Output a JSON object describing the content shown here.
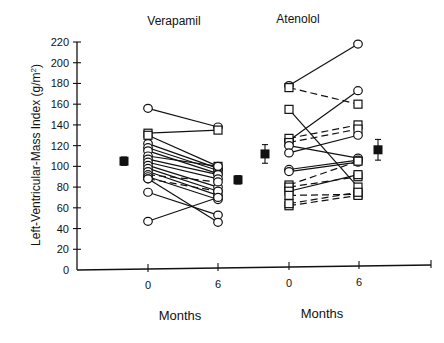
{
  "chart_data": {
    "type": "scatter",
    "title": "",
    "panels": [
      {
        "name": "Verapamil",
        "xlabel": "Months",
        "x_ticks": [
          "0",
          "6"
        ],
        "pairs": [
          {
            "m0": 156,
            "m6": 138,
            "marker": "circle",
            "style": "solid"
          },
          {
            "m0": 132,
            "m6": 135,
            "marker": "square",
            "style": "solid"
          },
          {
            "m0": 130,
            "m6": 100,
            "marker": "square",
            "style": "solid"
          },
          {
            "m0": 122,
            "m6": 98,
            "marker": "circle",
            "style": "solid"
          },
          {
            "m0": 118,
            "m6": 96,
            "marker": "circle",
            "style": "solid"
          },
          {
            "m0": 115,
            "m6": 93,
            "marker": "circle",
            "style": "solid"
          },
          {
            "m0": 110,
            "m6": 100,
            "marker": "circle",
            "style": "solid"
          },
          {
            "m0": 107,
            "m6": 92,
            "marker": "circle",
            "style": "solid"
          },
          {
            "m0": 104,
            "m6": 88,
            "marker": "circle",
            "style": "solid"
          },
          {
            "m0": 101,
            "m6": 80,
            "marker": "circle",
            "style": "solid"
          },
          {
            "m0": 98,
            "m6": 76,
            "marker": "circle",
            "style": "solid"
          },
          {
            "m0": 95,
            "m6": 72,
            "marker": "circle",
            "style": "solid"
          },
          {
            "m0": 92,
            "m6": 85,
            "marker": "circle",
            "style": "dashed"
          },
          {
            "m0": 90,
            "m6": 68,
            "marker": "circle",
            "style": "solid"
          },
          {
            "m0": 88,
            "m6": 76,
            "marker": "circle",
            "style": "dashed"
          },
          {
            "m0": 75,
            "m6": 53,
            "marker": "circle",
            "style": "solid"
          },
          {
            "m0": 88,
            "m6": 46,
            "marker": "circle",
            "style": "solid"
          },
          {
            "m0": 47,
            "m6": 70,
            "marker": "circle",
            "style": "solid"
          }
        ],
        "mean_before": {
          "value": 105,
          "error": 4
        },
        "mean_after": {
          "value": 87,
          "error": 4
        }
      },
      {
        "name": "Atenolol",
        "xlabel": "Months",
        "x_ticks": [
          "0",
          "6"
        ],
        "pairs": [
          {
            "m0": 178,
            "m6": 218,
            "marker": "circle",
            "style": "solid"
          },
          {
            "m0": 176,
            "m6": 160,
            "marker": "square",
            "style": "dashed"
          },
          {
            "m0": 155,
            "m6": 80,
            "marker": "square",
            "style": "solid"
          },
          {
            "m0": 125,
            "m6": 173,
            "marker": "circle",
            "style": "solid"
          },
          {
            "m0": 127,
            "m6": 140,
            "marker": "square",
            "style": "dashed"
          },
          {
            "m0": 123,
            "m6": 136,
            "marker": "square",
            "style": "dashed"
          },
          {
            "m0": 120,
            "m6": 108,
            "marker": "circle",
            "style": "solid"
          },
          {
            "m0": 113,
            "m6": 130,
            "marker": "circle",
            "style": "solid"
          },
          {
            "m0": 97,
            "m6": 106,
            "marker": "circle",
            "style": "solid"
          },
          {
            "m0": 95,
            "m6": 104,
            "marker": "circle",
            "style": "solid"
          },
          {
            "m0": 82,
            "m6": 105,
            "marker": "square",
            "style": "dashed"
          },
          {
            "m0": 80,
            "m6": 90,
            "marker": "square",
            "style": "dashed"
          },
          {
            "m0": 76,
            "m6": 92,
            "marker": "square",
            "style": "solid"
          },
          {
            "m0": 72,
            "m6": 73,
            "marker": "square",
            "style": "dashed"
          },
          {
            "m0": 62,
            "m6": 72,
            "marker": "square",
            "style": "dashed"
          },
          {
            "m0": 64,
            "m6": 75,
            "marker": "square",
            "style": "dashed"
          }
        ],
        "mean_before": {
          "value": 112,
          "error": 9
        },
        "mean_after": {
          "value": 116,
          "error": 10
        }
      }
    ],
    "ylabel": "Left-Ventricular-Mass Index (g/m²)",
    "ylim": [
      0,
      220
    ],
    "y_ticks": [
      0,
      20,
      40,
      60,
      80,
      100,
      120,
      140,
      160,
      180,
      200,
      220
    ],
    "grid": false,
    "legend": null
  },
  "labels": {
    "panel_left_title": "Verapamil",
    "panel_right_title": "Atenolol",
    "xlabel_left": "Months",
    "xlabel_right": "Months",
    "ylabel": "Left-Ventricular-Mass Index (g/m",
    "ylabel_sup": "2",
    "ylabel_tail": ")"
  }
}
